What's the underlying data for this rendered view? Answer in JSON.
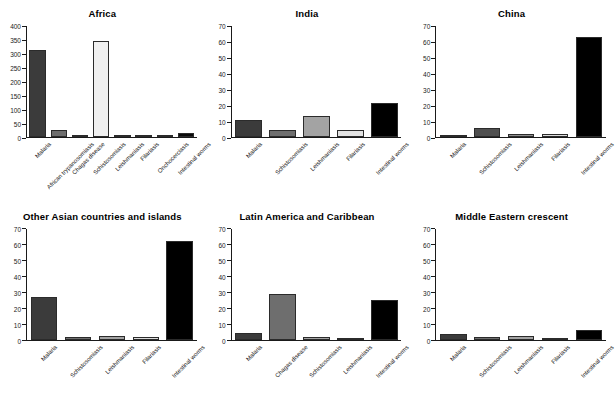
{
  "figure": {
    "type": "small-multiples-bar-chart",
    "panel_count": 6,
    "colors": {
      "axis": "#1a1a1a",
      "bar_border": "#2b2b2b",
      "background": "#ffffff",
      "shade_1": "#3b3b3b",
      "shade_2": "#6e6e6e",
      "shade_3": "#a3a3a3",
      "shade_4": "#d9d9d9",
      "shade_5": "#f0f0f0",
      "shade_black": "#000000"
    }
  },
  "chart_data": [
    {
      "type": "bar",
      "title": "Africa",
      "xlabel": "",
      "ylabel": "",
      "ylim": [
        0,
        400
      ],
      "yticks": [
        0,
        50,
        100,
        150,
        200,
        250,
        300,
        350,
        400
      ],
      "grid": false,
      "legend": "none",
      "categories": [
        "Malaria",
        "African trypanosomiasis",
        "Chagas disease",
        "Schistosomiasis",
        "Leishmaniasis",
        "Filariasis",
        "Onchocerciasis",
        "Intestinal worms"
      ],
      "values": [
        315,
        26,
        4,
        347,
        9,
        8,
        9,
        13
      ],
      "bar_colors": [
        "#3b3b3b",
        "#6e6e6e",
        "#bdbdbd",
        "#f0f0f0",
        "#1a1a1a",
        "#8a8a8a",
        "#e8e8e8",
        "#0a0a0a"
      ]
    },
    {
      "type": "bar",
      "title": "India",
      "xlabel": "",
      "ylabel": "",
      "ylim": [
        0,
        70
      ],
      "yticks": [
        0,
        10,
        20,
        30,
        40,
        50,
        60,
        70
      ],
      "grid": false,
      "legend": "none",
      "categories": [
        "Malaria",
        "Schistosomiasis",
        "Leishmaniasis",
        "Filariasis",
        "Intestinal worms"
      ],
      "values": [
        11,
        4.5,
        13,
        4.5,
        21.5
      ],
      "bar_colors": [
        "#3b3b3b",
        "#6e6e6e",
        "#a3a3a3",
        "#e2e2e2",
        "#000000"
      ]
    },
    {
      "type": "bar",
      "title": "China",
      "xlabel": "",
      "ylabel": "",
      "ylim": [
        0,
        70
      ],
      "yticks": [
        0,
        10,
        20,
        30,
        40,
        50,
        60,
        70
      ],
      "grid": false,
      "legend": "none",
      "categories": [
        "Malaria",
        "Schistosomiasis",
        "Leishmaniasis",
        "Filariasis",
        "Intestinal worms"
      ],
      "values": [
        1.3,
        6,
        2,
        2.2,
        63
      ],
      "bar_colors": [
        "#3b3b3b",
        "#4f4f4f",
        "#8f8f8f",
        "#dcdcdc",
        "#000000"
      ]
    },
    {
      "type": "bar",
      "title": "Other Asian countries and islands",
      "xlabel": "",
      "ylabel": "",
      "ylim": [
        0,
        70
      ],
      "yticks": [
        0,
        10,
        20,
        30,
        40,
        50,
        60,
        70
      ],
      "grid": false,
      "legend": "none",
      "categories": [
        "Malaria",
        "Schistosomiasis",
        "Leishmaniasis",
        "Filariasis",
        "Intestinal worms"
      ],
      "values": [
        26.5,
        1.3,
        2.3,
        1.7,
        62
      ],
      "bar_colors": [
        "#3b3b3b",
        "#6e6e6e",
        "#a3a3a3",
        "#dcdcdc",
        "#000000"
      ]
    },
    {
      "type": "bar",
      "title": "Latin America and Caribbean",
      "xlabel": "",
      "ylabel": "",
      "ylim": [
        0,
        70
      ],
      "yticks": [
        0,
        10,
        20,
        30,
        40,
        50,
        60,
        70
      ],
      "grid": false,
      "legend": "none",
      "categories": [
        "Malaria",
        "Chagas disease",
        "Schistosomiasis",
        "Leishmaniasis",
        "Intestinal worms"
      ],
      "values": [
        4.3,
        28.5,
        1.6,
        1,
        24.8
      ],
      "bar_colors": [
        "#3b3b3b",
        "#6e6e6e",
        "#a3a3a3",
        "#e2e2e2",
        "#000000"
      ]
    },
    {
      "type": "bar",
      "title": "Middle Eastern crescent",
      "xlabel": "",
      "ylabel": "",
      "ylim": [
        0,
        70
      ],
      "yticks": [
        0,
        10,
        20,
        30,
        40,
        50,
        60,
        70
      ],
      "grid": false,
      "legend": "none",
      "categories": [
        "Malaria",
        "Schistosomiasis",
        "Leishmaniasis",
        "Filariasis",
        "Intestinal worms"
      ],
      "values": [
        3.5,
        1.7,
        2.2,
        1,
        6
      ],
      "bar_colors": [
        "#3b3b3b",
        "#6e6e6e",
        "#a3a3a3",
        "#e2e2e2",
        "#000000"
      ]
    }
  ]
}
